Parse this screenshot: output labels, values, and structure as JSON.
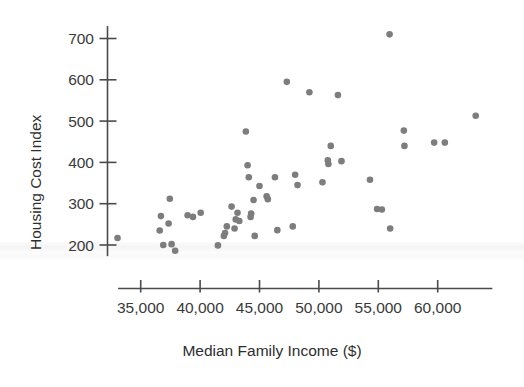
{
  "chart_data": {
    "type": "scatter",
    "title": "",
    "xlabel": "Median Family Income ($)",
    "ylabel": "Housing Cost Index",
    "xlim": [
      33200,
      64500
    ],
    "ylim": [
      170,
      730
    ],
    "grid": false,
    "legend": "none",
    "marker": {
      "shape": "circle",
      "color": "#7d7d7d",
      "size": 6
    },
    "xticks": [
      35000,
      40000,
      45000,
      50000,
      55000,
      60000
    ],
    "xticklabels": [
      "35,000",
      "40,000",
      "45,000",
      "50,000",
      "55,000",
      "60,000"
    ],
    "yticks": [
      200,
      300,
      400,
      500,
      600,
      700
    ],
    "yticklabels": [
      "200",
      "300",
      "400",
      "500",
      "600",
      "700"
    ],
    "points": [
      {
        "x": 33050,
        "y": 217
      },
      {
        "x": 36600,
        "y": 235
      },
      {
        "x": 36700,
        "y": 270
      },
      {
        "x": 36900,
        "y": 200
      },
      {
        "x": 37350,
        "y": 252
      },
      {
        "x": 37450,
        "y": 312
      },
      {
        "x": 37600,
        "y": 202
      },
      {
        "x": 37900,
        "y": 186
      },
      {
        "x": 38950,
        "y": 272
      },
      {
        "x": 39400,
        "y": 268
      },
      {
        "x": 40050,
        "y": 278
      },
      {
        "x": 41500,
        "y": 199
      },
      {
        "x": 42000,
        "y": 222
      },
      {
        "x": 42100,
        "y": 229
      },
      {
        "x": 42250,
        "y": 245
      },
      {
        "x": 42650,
        "y": 293
      },
      {
        "x": 42900,
        "y": 240
      },
      {
        "x": 43000,
        "y": 262
      },
      {
        "x": 43150,
        "y": 278
      },
      {
        "x": 43300,
        "y": 258
      },
      {
        "x": 43850,
        "y": 475
      },
      {
        "x": 44000,
        "y": 393
      },
      {
        "x": 44100,
        "y": 364
      },
      {
        "x": 44250,
        "y": 268
      },
      {
        "x": 44300,
        "y": 276
      },
      {
        "x": 44500,
        "y": 309
      },
      {
        "x": 44600,
        "y": 222
      },
      {
        "x": 45000,
        "y": 343
      },
      {
        "x": 45600,
        "y": 318
      },
      {
        "x": 45700,
        "y": 311
      },
      {
        "x": 46300,
        "y": 364
      },
      {
        "x": 46500,
        "y": 236
      },
      {
        "x": 47300,
        "y": 595
      },
      {
        "x": 47800,
        "y": 245
      },
      {
        "x": 48000,
        "y": 370
      },
      {
        "x": 48200,
        "y": 345
      },
      {
        "x": 49200,
        "y": 570
      },
      {
        "x": 50300,
        "y": 352
      },
      {
        "x": 50750,
        "y": 405
      },
      {
        "x": 50800,
        "y": 396
      },
      {
        "x": 51000,
        "y": 440
      },
      {
        "x": 51600,
        "y": 563
      },
      {
        "x": 51900,
        "y": 403
      },
      {
        "x": 54300,
        "y": 358
      },
      {
        "x": 54900,
        "y": 287
      },
      {
        "x": 55300,
        "y": 286
      },
      {
        "x": 55950,
        "y": 710
      },
      {
        "x": 56000,
        "y": 240
      },
      {
        "x": 57150,
        "y": 477
      },
      {
        "x": 57200,
        "y": 440
      },
      {
        "x": 59700,
        "y": 448
      },
      {
        "x": 60600,
        "y": 448
      },
      {
        "x": 63200,
        "y": 513
      }
    ]
  }
}
